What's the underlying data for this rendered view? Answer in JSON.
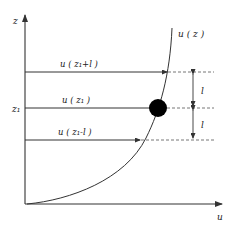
{
  "diagram": {
    "type": "mixing-length-profile",
    "axes": {
      "vertical_label": "z",
      "horizontal_label": "u",
      "z1_tick_label": "z₁"
    },
    "curve_label": "u ( z )",
    "levels": [
      {
        "id": "upper",
        "label": "u ( z₁+l )"
      },
      {
        "id": "middle",
        "label": "u ( z₁ )"
      },
      {
        "id": "lower",
        "label": "u ( z₁-l )"
      }
    ],
    "spacing_labels": [
      "l",
      "l"
    ],
    "colors": {
      "line": "#333333",
      "dashed": "#777777",
      "ball": "#000000"
    }
  }
}
